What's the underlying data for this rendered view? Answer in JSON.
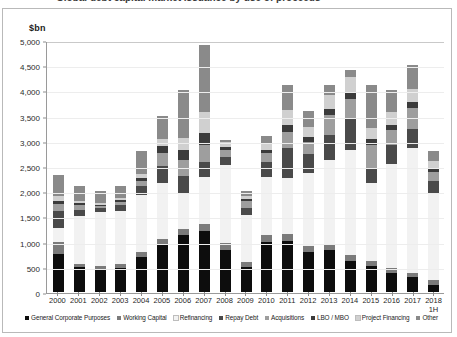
{
  "title_strip": "Global debt capital market issuance by use of proceeds",
  "unit_label": "$bn",
  "chart_data": {
    "type": "bar",
    "stacked": true,
    "title": "",
    "xlabel": "",
    "ylabel": "$bn",
    "ylim": [
      0,
      5000
    ],
    "yticks": [
      0,
      500,
      1000,
      1500,
      2000,
      2500,
      3000,
      3500,
      4000,
      4500,
      5000
    ],
    "ytick_labels": [
      "0",
      "500",
      "1,000",
      "1,500",
      "2,000",
      "2,500",
      "3,000",
      "3,500",
      "4,000",
      "4,500",
      "5,000"
    ],
    "grid": true,
    "legend_position": "bottom",
    "categories": [
      "2000",
      "2001",
      "2002",
      "2003",
      "2004",
      "2005",
      "2006",
      "2007",
      "2008",
      "2009",
      "2010",
      "2011",
      "2012",
      "2013",
      "2014",
      "2015",
      "2016",
      "2017",
      "2018 1H"
    ],
    "series": [
      {
        "name": "General Corporate Purposes",
        "color": "#0d0d0d",
        "values": [
          760,
          490,
          460,
          480,
          700,
          930,
          1130,
          1210,
          840,
          500,
          1000,
          1010,
          790,
          830,
          620,
          510,
          380,
          300,
          140
        ]
      },
      {
        "name": "Working Capital",
        "color": "#7b7b7b",
        "values": [
          240,
          75,
          60,
          70,
          100,
          115,
          120,
          140,
          130,
          90,
          125,
          135,
          120,
          95,
          110,
          105,
          90,
          75,
          100
        ]
      },
      {
        "name": "Refinancing",
        "color": "#f2f2f2",
        "values": [
          270,
          950,
          1070,
          1060,
          1120,
          1120,
          720,
          940,
          1560,
          930,
          1150,
          1110,
          1450,
          1700,
          2090,
          1540,
          2080,
          2480,
          1700
        ]
      },
      {
        "name": "Repay Debt",
        "color": "#4a4a4a",
        "values": [
          330,
          120,
          70,
          120,
          180,
          340,
          340,
          300,
          150,
          150,
          300,
          600,
          380,
          500,
          620,
          290,
          360,
          380,
          260
        ]
      },
      {
        "name": "Acquisitions",
        "color": "#9e9e9e",
        "values": [
          140,
          90,
          50,
          60,
          110,
          260,
          310,
          330,
          140,
          130,
          190,
          330,
          230,
          380,
          400,
          480,
          310,
          410,
          180
        ]
      },
      {
        "name": "LBO / MBO",
        "color": "#3b3b3b",
        "values": [
          60,
          40,
          20,
          30,
          60,
          140,
          200,
          230,
          50,
          40,
          60,
          130,
          100,
          120,
          130,
          110,
          100,
          120,
          70
        ]
      },
      {
        "name": "Project Financing",
        "color": "#d0d0d0",
        "values": [
          100,
          50,
          40,
          50,
          70,
          130,
          230,
          420,
          110,
          60,
          130,
          290,
          210,
          280,
          300,
          230,
          260,
          260,
          160
        ]
      },
      {
        "name": "Other",
        "color": "#8a8a8a",
        "values": [
          420,
          285,
          230,
          230,
          460,
          465,
          950,
          1330,
          30,
          100,
          145,
          495,
          320,
          195,
          130,
          835,
          420,
          475,
          190
        ]
      }
    ]
  }
}
